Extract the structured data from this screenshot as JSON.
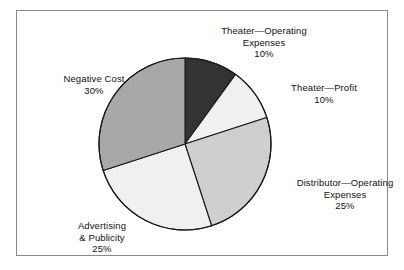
{
  "chart_data": {
    "type": "pie",
    "title": "",
    "subtitle": "",
    "xlabel": "",
    "ylabel": "",
    "legend_position": "none",
    "grid": false,
    "start_angle_deg": 0,
    "direction": "clockwise",
    "categories": [
      "Theater—Operating Expenses",
      "Theater—Profit",
      "Distributor—Operating Expenses",
      "Advertising & Publicity",
      "Negative Cost"
    ],
    "values": [
      10,
      10,
      25,
      25,
      30
    ],
    "value_labels": [
      "10%",
      "10%",
      "25%",
      "25%",
      "30%"
    ],
    "units": "percent",
    "total": 100,
    "slices": [
      {
        "name": "theater-operating-expenses",
        "label_lines": [
          "Theater—Operating",
          "Expenses"
        ],
        "percent_text": "10%",
        "value": 10,
        "color": "#333333"
      },
      {
        "name": "theater-profit",
        "label_lines": [
          "Theater—Profit"
        ],
        "percent_text": "10%",
        "value": 10,
        "color": "#f0f0f0"
      },
      {
        "name": "distributor-operating-expenses",
        "label_lines": [
          "Distributor—Operating",
          "Expenses"
        ],
        "percent_text": "25%",
        "value": 25,
        "color": "#cfcfcf"
      },
      {
        "name": "advertising-publicity",
        "label_lines": [
          "Advertising",
          "& Publicity"
        ],
        "percent_text": "25%",
        "value": 25,
        "color": "#f0f0f0"
      },
      {
        "name": "negative-cost",
        "label_lines": [
          "Negative Cost"
        ],
        "percent_text": "30%",
        "value": 30,
        "color": "#a8a8a8"
      }
    ]
  },
  "labels": {
    "theater_operating": {
      "line1": "Theater—Operating",
      "line2": "Expenses",
      "pct": "10%"
    },
    "theater_profit": {
      "line1": "Theater—Profit",
      "pct": "10%"
    },
    "distributor_operating": {
      "line1": "Distributor—Operating",
      "line2": "Expenses",
      "pct": "25%"
    },
    "advertising": {
      "line1": "Advertising",
      "line2": "& Publicity",
      "pct": "25%"
    },
    "negative_cost": {
      "line1": "Negative Cost",
      "pct": "30%"
    }
  },
  "style": {
    "frame_color": "#8a8a8a",
    "outline_color": "#1a1a1a",
    "background": "#ffffff",
    "text_color": "#111111"
  }
}
